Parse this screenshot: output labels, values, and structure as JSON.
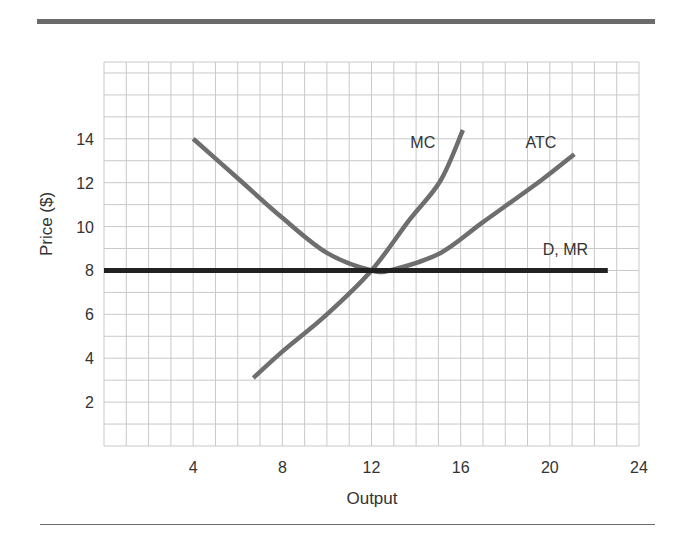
{
  "chart_data": {
    "type": "line",
    "title": "",
    "xlabel": "Output",
    "ylabel": "Price ($)",
    "xlim": [
      0,
      24
    ],
    "ylim": [
      0,
      17.5
    ],
    "x_ticks": [
      4,
      8,
      12,
      16,
      20,
      24
    ],
    "y_ticks": [
      2,
      4,
      6,
      8,
      10,
      12,
      14
    ],
    "grid": true,
    "grid_x_step": 1,
    "grid_y_step": 1,
    "series": [
      {
        "name": "MC",
        "label": "MC",
        "color": "#6e6e6e",
        "x": [
          6.7,
          8,
          10,
          12,
          13.7,
          15.1,
          16.1
        ],
        "y": [
          3.1,
          4.3,
          6.0,
          8.0,
          10.3,
          12.1,
          14.4
        ]
      },
      {
        "name": "ATC",
        "label": "ATC",
        "color": "#6e6e6e",
        "x": [
          4,
          6,
          8,
          10,
          12,
          13,
          15.1,
          17,
          19.6,
          21.1
        ],
        "y": [
          14,
          12.2,
          10.4,
          8.8,
          8.0,
          8.05,
          8.8,
          10.2,
          12.1,
          13.3
        ]
      },
      {
        "name": "D, MR",
        "label": "D, MR",
        "color": "#222222",
        "x": [
          0,
          22.6
        ],
        "y": [
          8,
          8
        ]
      }
    ],
    "annotations": [
      {
        "text": "MC",
        "x": 14.3,
        "y": 13.6
      },
      {
        "text": "ATC",
        "x": 19.6,
        "y": 13.6
      },
      {
        "text": "D, MR",
        "x": 20.7,
        "y": 8.7
      }
    ],
    "legend": "none (curves labeled directly)"
  }
}
